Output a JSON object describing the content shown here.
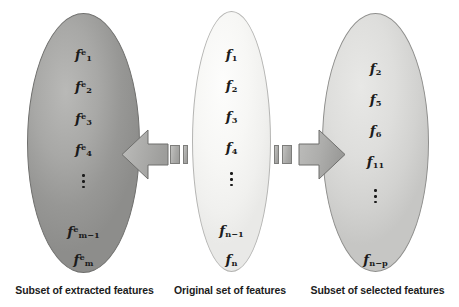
{
  "figure": {
    "type": "concept-diagram",
    "background_color": "#ffffff"
  },
  "groups": [
    {
      "id": "extracted",
      "caption": "Subset of extracted features",
      "fill_color": "#9a9a98",
      "items": [
        {
          "base": "f",
          "sup": "e",
          "sub": "1"
        },
        {
          "base": "f",
          "sup": "e",
          "sub": "2"
        },
        {
          "base": "f",
          "sup": "e",
          "sub": "3"
        },
        {
          "base": "f",
          "sup": "e",
          "sub": "4"
        },
        {
          "base": "⋮",
          "sup": "",
          "sub": ""
        },
        {
          "base": "f",
          "sup": "e",
          "sub": "m−1"
        },
        {
          "base": "f",
          "sup": "e",
          "sub": "m"
        }
      ]
    },
    {
      "id": "original",
      "caption": "Original set of features",
      "fill_color": "#f5f5f3",
      "items": [
        {
          "base": "f",
          "sup": "",
          "sub": "1"
        },
        {
          "base": "f",
          "sup": "",
          "sub": "2"
        },
        {
          "base": "f",
          "sup": "",
          "sub": "3"
        },
        {
          "base": "f",
          "sup": "",
          "sub": "4"
        },
        {
          "base": "⋮",
          "sup": "",
          "sub": ""
        },
        {
          "base": "f",
          "sup": "",
          "sub": "n−1"
        },
        {
          "base": "f",
          "sup": "",
          "sub": "n"
        }
      ]
    },
    {
      "id": "selected",
      "caption": "Subset of selected features",
      "fill_color": "#d8d8d6",
      "items": [
        {
          "base": "f",
          "sup": "",
          "sub": "2"
        },
        {
          "base": "f",
          "sup": "",
          "sub": "5"
        },
        {
          "base": "f",
          "sup": "",
          "sub": "6"
        },
        {
          "base": "f",
          "sup": "",
          "sub": "11"
        },
        {
          "base": "⋮",
          "sup": "",
          "sub": ""
        },
        {
          "base": "f",
          "sup": "",
          "sub": "n−p"
        }
      ]
    }
  ],
  "arrows": [
    {
      "id": "extraction-arrow",
      "direction": "left",
      "from": "original",
      "to": "extracted",
      "color": "#a8a8a6"
    },
    {
      "id": "selection-arrow",
      "direction": "right",
      "from": "original",
      "to": "selected",
      "color": "#a8a8a6"
    }
  ]
}
